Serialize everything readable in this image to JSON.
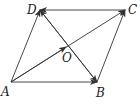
{
  "figure": {
    "type": "vector-parallelogram",
    "points": {
      "A": {
        "label": "A",
        "x": 11,
        "y": 82
      },
      "B": {
        "label": "B",
        "x": 97,
        "y": 82
      },
      "C": {
        "label": "C",
        "x": 125,
        "y": 10
      },
      "D": {
        "label": "D",
        "x": 40,
        "y": 10
      },
      "O": {
        "label": "O",
        "x": 68,
        "y": 46
      }
    },
    "vectors": [
      {
        "from": "A",
        "to": "B"
      },
      {
        "from": "A",
        "to": "D"
      },
      {
        "from": "B",
        "to": "C"
      },
      {
        "from": "C",
        "to": "D"
      },
      {
        "from": "A",
        "to": "C"
      },
      {
        "from": "B",
        "to": "D"
      },
      {
        "from": "D",
        "to": "B"
      }
    ],
    "stroke_color": "#333333",
    "caption": ""
  }
}
